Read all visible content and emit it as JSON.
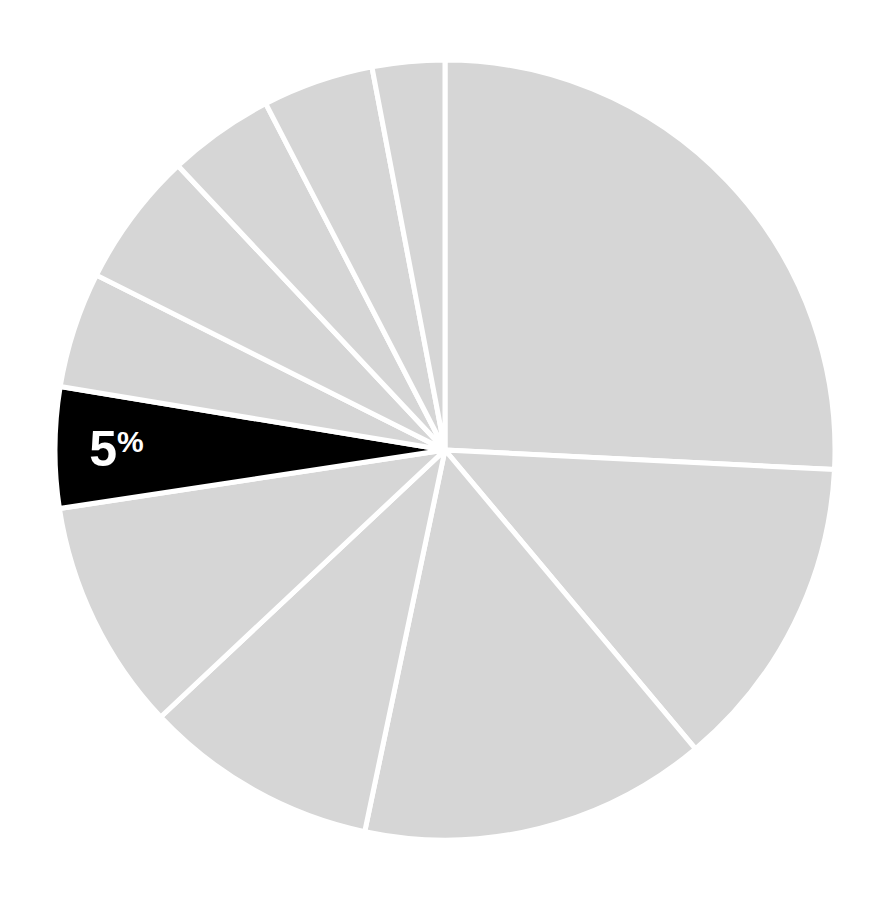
{
  "chart_data": {
    "type": "pie",
    "title": "",
    "start_angle_deg": 0,
    "direction": "clockwise",
    "center": [
      445,
      450
    ],
    "radius": 390,
    "slice_color": "#d6d6d6",
    "highlight_color": "#000000",
    "separator_color": "#ffffff",
    "slices": [
      {
        "label": "",
        "value": 25.8,
        "highlight": false
      },
      {
        "label": "",
        "value": 13.1,
        "highlight": false
      },
      {
        "label": "",
        "value": 14.4,
        "highlight": false
      },
      {
        "label": "",
        "value": 9.7,
        "highlight": false
      },
      {
        "label": "",
        "value": 9.6,
        "highlight": false
      },
      {
        "label": "5%",
        "value": 5.0,
        "highlight": true
      },
      {
        "label": "",
        "value": 4.8,
        "highlight": false
      },
      {
        "label": "",
        "value": 5.6,
        "highlight": false
      },
      {
        "label": "",
        "value": 4.4,
        "highlight": false
      },
      {
        "label": "",
        "value": 4.6,
        "highlight": false
      },
      {
        "label": "",
        "value": 3.0,
        "highlight": false
      }
    ],
    "annotations": [
      {
        "text": "5",
        "suffix": "%",
        "slice_index": 5
      }
    ],
    "legend": null
  }
}
